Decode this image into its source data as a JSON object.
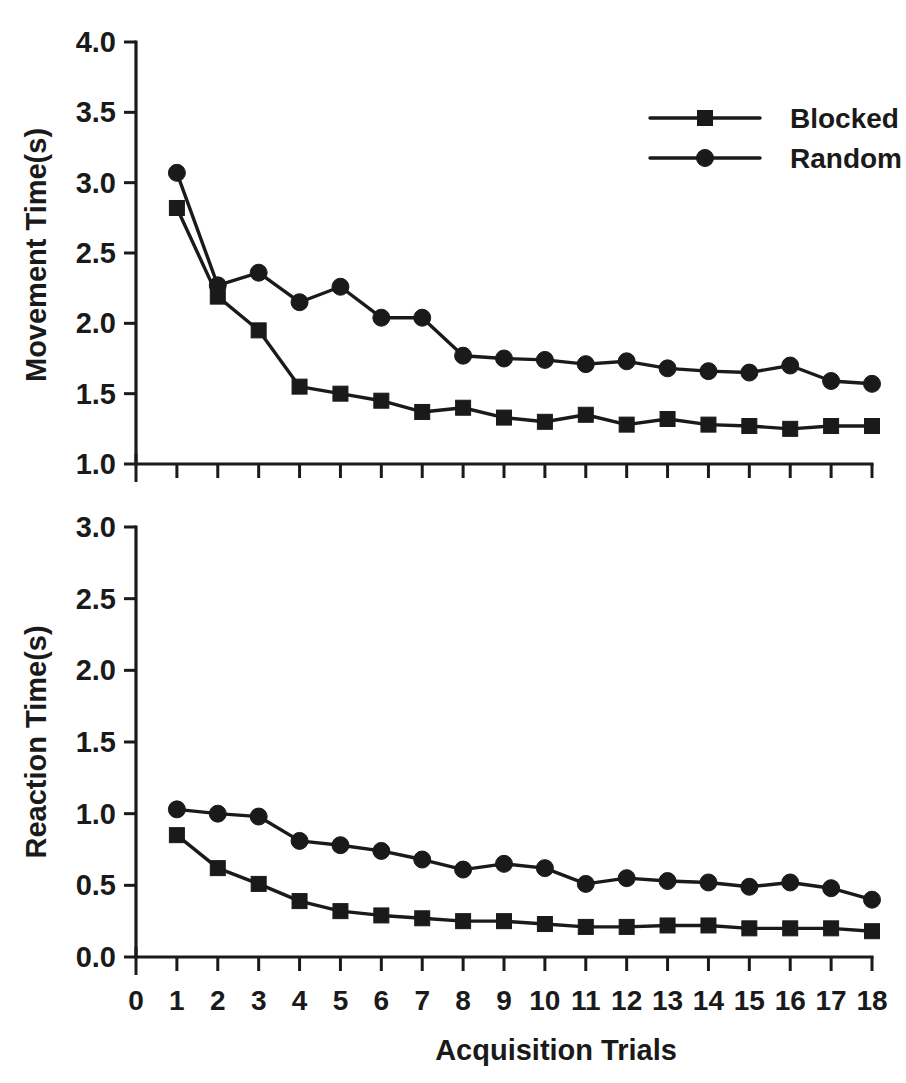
{
  "figure": {
    "background_color": "#ffffff",
    "ink_color": "#1a1a1a",
    "xlabel": "Acquisition Trials",
    "legend": {
      "position": "top-right of upper panel",
      "entries": [
        {
          "label": "Blocked",
          "marker": "square"
        },
        {
          "label": "Random",
          "marker": "circle"
        }
      ]
    }
  },
  "chart_data": [
    {
      "type": "line",
      "panel": "upper",
      "title": "",
      "xlabel": "Acquisition Trials",
      "ylabel": "Movement Time(s)",
      "x": [
        1,
        2,
        3,
        4,
        5,
        6,
        7,
        8,
        9,
        10,
        11,
        12,
        13,
        14,
        15,
        16,
        17,
        18
      ],
      "xlim": [
        0,
        18
      ],
      "ylim": [
        1.0,
        4.0
      ],
      "xticks": [
        0,
        1,
        2,
        3,
        4,
        5,
        6,
        7,
        8,
        9,
        10,
        11,
        12,
        13,
        14,
        15,
        16,
        17,
        18
      ],
      "yticks": [
        1.0,
        1.5,
        2.0,
        2.5,
        3.0,
        3.5,
        4.0
      ],
      "ytick_labels": [
        "1.0",
        "1.5",
        "2.0",
        "2.5",
        "3.0",
        "3.5",
        "4.0"
      ],
      "grid": false,
      "legend_position": "upper right",
      "series": [
        {
          "name": "Blocked",
          "marker": "square",
          "values": [
            2.82,
            2.19,
            1.95,
            1.55,
            1.5,
            1.45,
            1.37,
            1.4,
            1.33,
            1.3,
            1.35,
            1.28,
            1.32,
            1.28,
            1.27,
            1.25,
            1.27,
            1.27
          ]
        },
        {
          "name": "Random",
          "marker": "circle",
          "values": [
            3.07,
            2.27,
            2.36,
            2.15,
            2.26,
            2.04,
            2.04,
            1.77,
            1.75,
            1.74,
            1.71,
            1.73,
            1.68,
            1.66,
            1.65,
            1.7,
            1.59,
            1.57
          ]
        }
      ]
    },
    {
      "type": "line",
      "panel": "lower",
      "title": "",
      "xlabel": "Acquisition Trials",
      "ylabel": "Reaction Time(s)",
      "x": [
        1,
        2,
        3,
        4,
        5,
        6,
        7,
        8,
        9,
        10,
        11,
        12,
        13,
        14,
        15,
        16,
        17,
        18
      ],
      "xlim": [
        0,
        18
      ],
      "ylim": [
        0.0,
        3.0
      ],
      "xticks": [
        0,
        1,
        2,
        3,
        4,
        5,
        6,
        7,
        8,
        9,
        10,
        11,
        12,
        13,
        14,
        15,
        16,
        17,
        18
      ],
      "yticks": [
        0.0,
        0.5,
        1.0,
        1.5,
        2.0,
        2.5,
        3.0
      ],
      "ytick_labels": [
        "0.0",
        "0.5",
        "1.0",
        "1.5",
        "2.0",
        "2.5",
        "3.0"
      ],
      "grid": false,
      "legend_position": "none",
      "series": [
        {
          "name": "Blocked",
          "marker": "square",
          "values": [
            0.85,
            0.62,
            0.51,
            0.39,
            0.32,
            0.29,
            0.27,
            0.25,
            0.25,
            0.23,
            0.21,
            0.21,
            0.22,
            0.22,
            0.2,
            0.2,
            0.2,
            0.18
          ]
        },
        {
          "name": "Random",
          "marker": "circle",
          "values": [
            1.03,
            1.0,
            0.98,
            0.81,
            0.78,
            0.74,
            0.68,
            0.61,
            0.65,
            0.62,
            0.51,
            0.55,
            0.53,
            0.52,
            0.49,
            0.52,
            0.48,
            0.4
          ]
        }
      ]
    }
  ]
}
